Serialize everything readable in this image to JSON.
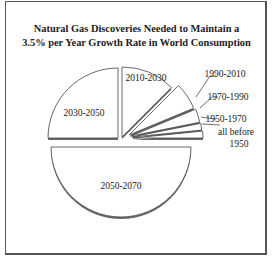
{
  "chart_data": {
    "type": "pie",
    "title": "Natural Gas Discoveries Needed to Maintain a 3.5% per Year Growth Rate in World Consumption",
    "title_lines": [
      "Natural Gas Discoveries Needed to Maintain a",
      "3.5% per Year Growth Rate in World Consumption"
    ],
    "exploded": true,
    "labels": [
      "2050-2070",
      "2030-2050",
      "2010-2030",
      "1990-2010",
      "1970-1990",
      "1950-1970",
      "all before 1950"
    ],
    "values": [
      50,
      25,
      12.5,
      6.25,
      3.125,
      1.5625,
      1.5625
    ],
    "unit": "% of total discoveries (approx.)",
    "legend": "none (labels placed on/next to slices)"
  },
  "colors": {
    "fill": "#ffffff",
    "stroke": "#444444",
    "shadow": "#6a6a6a",
    "frame": "#555555"
  }
}
